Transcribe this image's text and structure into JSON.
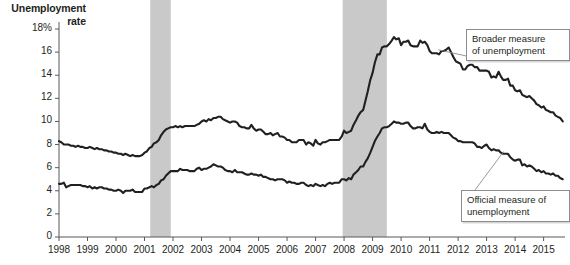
{
  "chart_data": {
    "type": "line",
    "title": "Unemployment\nrate",
    "xlabel": "",
    "ylabel": "Unemployment rate",
    "ylim": [
      0,
      18
    ],
    "xlim": [
      1998,
      2015.75
    ],
    "grid": false,
    "legend_position": "annotations",
    "y_ticks": [
      "18%",
      "16",
      "14",
      "12",
      "10",
      "8",
      "6",
      "4",
      "2",
      "0"
    ],
    "y_tick_values": [
      18,
      16,
      14,
      12,
      10,
      8,
      6,
      4,
      2,
      0
    ],
    "x_ticks": [
      "1998",
      "1999",
      "2000",
      "2001",
      "2002",
      "2003",
      "2004",
      "2005",
      "2006",
      "2007",
      "2008",
      "2009",
      "2010",
      "2011",
      "2012",
      "2013",
      "2014",
      "2015"
    ],
    "x_tick_values": [
      1998,
      1999,
      2000,
      2001,
      2002,
      2003,
      2004,
      2005,
      2006,
      2007,
      2008,
      2009,
      2010,
      2011,
      2012,
      2013,
      2014,
      2015
    ],
    "annotations": [
      {
        "name": "broader-callout",
        "text": "Broader measure\nof unemployment",
        "target_x": 2011.3,
        "target_y": 16.2
      },
      {
        "name": "official-callout",
        "text": "Official measure of\nunemployment",
        "target_x": 2013.6,
        "target_y": 7.4
      }
    ],
    "shaded_regions": [
      {
        "name": "recession-2001",
        "x0": 2001.2,
        "x1": 2001.92,
        "color": "#c9c9c9"
      },
      {
        "name": "recession-2008",
        "x0": 2007.95,
        "x1": 2009.5,
        "color": "#c9c9c9"
      }
    ],
    "series": [
      {
        "name": "Broader measure of unemployment",
        "color": "#231f20",
        "x": [
          1998.0,
          1998.08,
          1998.17,
          1998.25,
          1998.33,
          1998.42,
          1998.5,
          1998.58,
          1998.67,
          1998.75,
          1998.83,
          1998.92,
          1999.0,
          1999.08,
          1999.17,
          1999.25,
          1999.33,
          1999.42,
          1999.5,
          1999.58,
          1999.67,
          1999.75,
          1999.83,
          1999.92,
          2000.0,
          2000.08,
          2000.17,
          2000.25,
          2000.33,
          2000.42,
          2000.5,
          2000.58,
          2000.67,
          2000.75,
          2000.83,
          2000.92,
          2001.0,
          2001.08,
          2001.17,
          2001.25,
          2001.33,
          2001.42,
          2001.5,
          2001.58,
          2001.67,
          2001.75,
          2001.83,
          2001.92,
          2002.0,
          2002.08,
          2002.17,
          2002.25,
          2002.33,
          2002.42,
          2002.5,
          2002.58,
          2002.67,
          2002.75,
          2002.83,
          2002.92,
          2003.0,
          2003.08,
          2003.17,
          2003.25,
          2003.33,
          2003.42,
          2003.5,
          2003.58,
          2003.67,
          2003.75,
          2003.83,
          2003.92,
          2004.0,
          2004.08,
          2004.17,
          2004.25,
          2004.33,
          2004.42,
          2004.5,
          2004.58,
          2004.67,
          2004.75,
          2004.83,
          2004.92,
          2005.0,
          2005.08,
          2005.17,
          2005.25,
          2005.33,
          2005.42,
          2005.5,
          2005.58,
          2005.67,
          2005.75,
          2005.83,
          2005.92,
          2006.0,
          2006.08,
          2006.17,
          2006.25,
          2006.33,
          2006.42,
          2006.5,
          2006.58,
          2006.67,
          2006.75,
          2006.83,
          2006.92,
          2007.0,
          2007.08,
          2007.17,
          2007.25,
          2007.33,
          2007.42,
          2007.5,
          2007.58,
          2007.67,
          2007.75,
          2007.83,
          2007.92,
          2008.0,
          2008.08,
          2008.17,
          2008.25,
          2008.33,
          2008.42,
          2008.5,
          2008.58,
          2008.67,
          2008.75,
          2008.83,
          2008.92,
          2009.0,
          2009.08,
          2009.17,
          2009.25,
          2009.33,
          2009.42,
          2009.5,
          2009.58,
          2009.67,
          2009.75,
          2009.83,
          2009.92,
          2010.0,
          2010.08,
          2010.17,
          2010.25,
          2010.33,
          2010.42,
          2010.5,
          2010.58,
          2010.67,
          2010.75,
          2010.83,
          2010.92,
          2011.0,
          2011.08,
          2011.17,
          2011.25,
          2011.33,
          2011.42,
          2011.5,
          2011.58,
          2011.67,
          2011.75,
          2011.83,
          2011.92,
          2012.0,
          2012.08,
          2012.17,
          2012.25,
          2012.33,
          2012.42,
          2012.5,
          2012.58,
          2012.67,
          2012.75,
          2012.83,
          2012.92,
          2013.0,
          2013.08,
          2013.17,
          2013.25,
          2013.33,
          2013.42,
          2013.5,
          2013.58,
          2013.67,
          2013.75,
          2013.83,
          2013.92,
          2014.0,
          2014.08,
          2014.17,
          2014.25,
          2014.33,
          2014.42,
          2014.5,
          2014.58,
          2014.67,
          2014.75,
          2014.83,
          2014.92,
          2015.0,
          2015.08,
          2015.17,
          2015.25,
          2015.33,
          2015.42,
          2015.5,
          2015.58,
          2015.67
        ],
        "values": [
          8.3,
          8.2,
          8.0,
          8.0,
          8.0,
          7.9,
          7.9,
          7.8,
          7.9,
          7.8,
          7.8,
          7.7,
          7.7,
          7.8,
          7.7,
          7.6,
          7.7,
          7.6,
          7.6,
          7.5,
          7.5,
          7.4,
          7.4,
          7.3,
          7.3,
          7.2,
          7.2,
          7.1,
          7.2,
          7.1,
          7.0,
          7.1,
          7.0,
          7.0,
          7.0,
          7.1,
          7.3,
          7.4,
          7.7,
          7.8,
          8.1,
          8.2,
          8.4,
          8.8,
          9.1,
          9.3,
          9.4,
          9.5,
          9.5,
          9.6,
          9.5,
          9.6,
          9.5,
          9.6,
          9.6,
          9.6,
          9.6,
          9.6,
          9.7,
          9.8,
          10.0,
          10.1,
          10.0,
          10.2,
          10.1,
          10.3,
          10.3,
          10.4,
          10.4,
          10.2,
          10.1,
          10.0,
          9.9,
          10.0,
          10.0,
          9.9,
          9.6,
          9.5,
          9.5,
          9.4,
          9.4,
          9.7,
          9.4,
          9.2,
          9.3,
          9.3,
          9.1,
          8.9,
          8.9,
          9.0,
          8.8,
          8.9,
          9.0,
          8.7,
          8.7,
          8.6,
          8.4,
          8.4,
          8.2,
          8.2,
          8.2,
          8.4,
          8.4,
          8.4,
          8.0,
          8.2,
          8.1,
          7.9,
          8.4,
          8.1,
          8.0,
          8.2,
          8.2,
          8.3,
          8.4,
          8.4,
          8.4,
          8.4,
          8.4,
          8.7,
          9.2,
          9.0,
          9.1,
          9.2,
          9.7,
          10.1,
          10.5,
          10.8,
          11.0,
          11.8,
          12.6,
          13.6,
          14.2,
          15.1,
          15.8,
          15.8,
          16.4,
          16.5,
          16.5,
          16.7,
          17.0,
          17.3,
          17.1,
          17.2,
          16.6,
          16.9,
          16.9,
          17.0,
          16.6,
          16.5,
          16.5,
          16.5,
          17.0,
          16.8,
          16.9,
          16.6,
          16.1,
          15.9,
          15.9,
          15.9,
          15.8,
          16.1,
          16.1,
          16.2,
          16.4,
          16.0,
          15.6,
          15.2,
          15.1,
          15.0,
          14.5,
          14.5,
          14.8,
          14.9,
          14.9,
          14.7,
          14.7,
          14.4,
          14.4,
          14.4,
          14.4,
          14.3,
          13.8,
          13.9,
          13.8,
          14.3,
          13.9,
          13.6,
          13.6,
          13.7,
          13.1,
          13.1,
          12.7,
          12.6,
          12.7,
          12.3,
          12.2,
          12.1,
          12.2,
          12.0,
          11.8,
          11.5,
          11.4,
          11.2,
          11.3,
          11.0,
          10.9,
          10.8,
          10.8,
          10.5,
          10.4,
          10.3,
          10.0
        ]
      },
      {
        "name": "Official measure of unemployment",
        "color": "#231f20",
        "x": [
          1998.0,
          1998.08,
          1998.17,
          1998.25,
          1998.33,
          1998.42,
          1998.5,
          1998.58,
          1998.67,
          1998.75,
          1998.83,
          1998.92,
          1999.0,
          1999.08,
          1999.17,
          1999.25,
          1999.33,
          1999.42,
          1999.5,
          1999.58,
          1999.67,
          1999.75,
          1999.83,
          1999.92,
          2000.0,
          2000.08,
          2000.17,
          2000.25,
          2000.33,
          2000.42,
          2000.5,
          2000.58,
          2000.67,
          2000.75,
          2000.83,
          2000.92,
          2001.0,
          2001.08,
          2001.17,
          2001.25,
          2001.33,
          2001.42,
          2001.5,
          2001.58,
          2001.67,
          2001.75,
          2001.83,
          2001.92,
          2002.0,
          2002.08,
          2002.17,
          2002.25,
          2002.33,
          2002.42,
          2002.5,
          2002.58,
          2002.67,
          2002.75,
          2002.83,
          2002.92,
          2003.0,
          2003.08,
          2003.17,
          2003.25,
          2003.33,
          2003.42,
          2003.5,
          2003.58,
          2003.67,
          2003.75,
          2003.83,
          2003.92,
          2004.0,
          2004.08,
          2004.17,
          2004.25,
          2004.33,
          2004.42,
          2004.5,
          2004.58,
          2004.67,
          2004.75,
          2004.83,
          2004.92,
          2005.0,
          2005.08,
          2005.17,
          2005.25,
          2005.33,
          2005.42,
          2005.5,
          2005.58,
          2005.67,
          2005.75,
          2005.83,
          2005.92,
          2006.0,
          2006.08,
          2006.17,
          2006.25,
          2006.33,
          2006.42,
          2006.5,
          2006.58,
          2006.67,
          2006.75,
          2006.83,
          2006.92,
          2007.0,
          2007.08,
          2007.17,
          2007.25,
          2007.33,
          2007.42,
          2007.5,
          2007.58,
          2007.67,
          2007.75,
          2007.83,
          2007.92,
          2008.0,
          2008.08,
          2008.17,
          2008.25,
          2008.33,
          2008.42,
          2008.5,
          2008.58,
          2008.67,
          2008.75,
          2008.83,
          2008.92,
          2009.0,
          2009.08,
          2009.17,
          2009.25,
          2009.33,
          2009.42,
          2009.5,
          2009.58,
          2009.67,
          2009.75,
          2009.83,
          2009.92,
          2010.0,
          2010.08,
          2010.17,
          2010.25,
          2010.33,
          2010.42,
          2010.5,
          2010.58,
          2010.67,
          2010.75,
          2010.83,
          2010.92,
          2011.0,
          2011.08,
          2011.17,
          2011.25,
          2011.33,
          2011.42,
          2011.5,
          2011.58,
          2011.67,
          2011.75,
          2011.83,
          2011.92,
          2012.0,
          2012.08,
          2012.17,
          2012.25,
          2012.33,
          2012.42,
          2012.5,
          2012.58,
          2012.67,
          2012.75,
          2012.83,
          2012.92,
          2013.0,
          2013.08,
          2013.17,
          2013.25,
          2013.33,
          2013.42,
          2013.5,
          2013.58,
          2013.67,
          2013.75,
          2013.83,
          2013.92,
          2014.0,
          2014.08,
          2014.17,
          2014.25,
          2014.33,
          2014.42,
          2014.5,
          2014.58,
          2014.67,
          2014.75,
          2014.83,
          2014.92,
          2015.0,
          2015.08,
          2015.17,
          2015.25,
          2015.33,
          2015.42,
          2015.5,
          2015.58,
          2015.67
        ],
        "values": [
          4.6,
          4.6,
          4.7,
          4.3,
          4.4,
          4.5,
          4.5,
          4.5,
          4.5,
          4.5,
          4.4,
          4.4,
          4.3,
          4.4,
          4.2,
          4.3,
          4.2,
          4.3,
          4.3,
          4.2,
          4.2,
          4.1,
          4.1,
          4.0,
          4.0,
          4.1,
          4.0,
          3.8,
          4.0,
          4.0,
          4.0,
          4.1,
          3.9,
          3.9,
          3.9,
          3.9,
          4.2,
          4.2,
          4.3,
          4.4,
          4.3,
          4.5,
          4.6,
          4.9,
          5.0,
          5.3,
          5.5,
          5.7,
          5.7,
          5.7,
          5.7,
          5.9,
          5.8,
          5.8,
          5.8,
          5.7,
          5.7,
          5.7,
          5.9,
          6.0,
          5.8,
          5.9,
          5.9,
          6.0,
          6.1,
          6.3,
          6.2,
          6.1,
          6.1,
          6.0,
          5.8,
          5.7,
          5.7,
          5.6,
          5.8,
          5.6,
          5.6,
          5.6,
          5.5,
          5.4,
          5.4,
          5.5,
          5.4,
          5.4,
          5.3,
          5.4,
          5.2,
          5.2,
          5.1,
          5.0,
          5.0,
          4.9,
          5.0,
          5.0,
          5.0,
          4.9,
          4.7,
          4.8,
          4.7,
          4.7,
          4.6,
          4.6,
          4.7,
          4.7,
          4.5,
          4.4,
          4.5,
          4.4,
          4.6,
          4.5,
          4.4,
          4.5,
          4.4,
          4.6,
          4.7,
          4.6,
          4.7,
          4.7,
          4.7,
          5.0,
          5.0,
          4.9,
          5.1,
          5.0,
          5.4,
          5.6,
          5.8,
          6.1,
          6.1,
          6.5,
          6.8,
          7.3,
          7.8,
          8.3,
          8.7,
          9.0,
          9.4,
          9.5,
          9.5,
          9.6,
          9.8,
          10.0,
          9.9,
          9.9,
          9.8,
          9.8,
          9.9,
          9.9,
          9.6,
          9.4,
          9.4,
          9.5,
          9.5,
          9.4,
          9.8,
          9.3,
          9.1,
          9.0,
          9.0,
          9.1,
          9.0,
          9.1,
          9.0,
          9.0,
          9.0,
          8.8,
          8.6,
          8.5,
          8.3,
          8.3,
          8.2,
          8.2,
          8.2,
          8.2,
          8.2,
          8.1,
          7.8,
          7.8,
          7.7,
          7.9,
          8.0,
          7.7,
          7.5,
          7.6,
          7.5,
          7.5,
          7.3,
          7.2,
          7.2,
          7.2,
          6.9,
          6.7,
          6.6,
          6.7,
          6.7,
          6.2,
          6.3,
          6.1,
          6.2,
          6.1,
          5.9,
          5.7,
          5.8,
          5.6,
          5.7,
          5.5,
          5.5,
          5.4,
          5.5,
          5.3,
          5.3,
          5.1,
          5.0
        ]
      }
    ]
  }
}
